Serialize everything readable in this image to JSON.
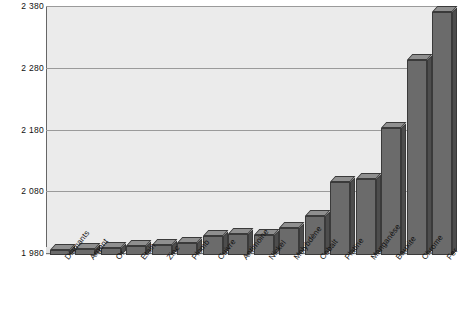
{
  "caption_remnant": "",
  "chart_data": {
    "type": "bar",
    "title": "",
    "subtitle": "",
    "xlabel": "",
    "ylabel": "",
    "ylim": [
      1980,
      2380
    ],
    "yticks": [
      1980,
      2080,
      2180,
      2280,
      2380
    ],
    "ytick_labels": [
      "1 980",
      "2 080",
      "2 180",
      "2 280",
      "2 380"
    ],
    "grid": true,
    "legend": "none",
    "threeD": true,
    "categories": [
      "Diamants",
      "Argent",
      "Or",
      "Etain",
      "Zinc",
      "Plomb",
      "Cuivre",
      "Antimoine",
      "Nickel",
      "Molybdène",
      "Cobalt",
      "Platine",
      "Manganèse",
      "Bauxite",
      "Chrome",
      "Fer"
    ],
    "values": [
      1988,
      1990,
      1992,
      1994,
      1996,
      1999,
      2011,
      2014,
      2013,
      2023,
      2043,
      2098,
      2103,
      2186,
      2296,
      2374
    ],
    "series": [
      {
        "name": "Année d'épuisement",
        "values": [
          1988,
          1990,
          1992,
          1994,
          1996,
          1999,
          2011,
          2014,
          2013,
          2023,
          2043,
          2098,
          2103,
          2186,
          2296,
          2374
        ]
      }
    ],
    "colors": {
      "bar_front": "#6b6b6b",
      "bar_top": "#8f8f8f",
      "bar_side": "#4d4d4d",
      "bar_edge": "#3a3a3a",
      "plot_background": "#ebebeb",
      "gridline": "#9a9a9a",
      "axis": "#666666",
      "text": "#111111",
      "page_background": "#ffffff"
    }
  }
}
